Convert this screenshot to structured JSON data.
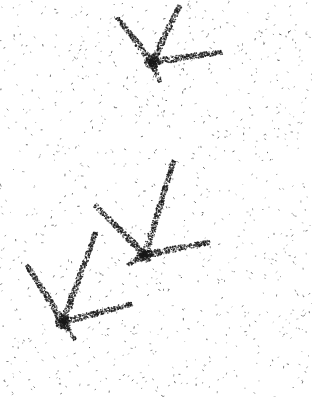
{
  "image": {
    "width": 312,
    "height": 397,
    "background": "#ffffff",
    "ink": "#1a1a1a",
    "description": "Stippled drawing of three bird-footprint shapes on speckled white background",
    "footprints": [
      {
        "vertex": [
          152,
          62
        ],
        "toes": [
          [
            117,
            17
          ],
          [
            180,
            5
          ],
          [
            222,
            52
          ]
        ],
        "heel": [
          160,
          82
        ]
      },
      {
        "vertex": [
          145,
          255
        ],
        "toes": [
          [
            95,
            205
          ],
          [
            174,
            160
          ],
          [
            210,
            242
          ]
        ],
        "heel": [
          127,
          265
        ]
      },
      {
        "vertex": [
          63,
          322
        ],
        "toes": [
          [
            27,
            265
          ],
          [
            96,
            232
          ],
          [
            132,
            304
          ]
        ],
        "heel": [
          75,
          340
        ]
      }
    ]
  }
}
